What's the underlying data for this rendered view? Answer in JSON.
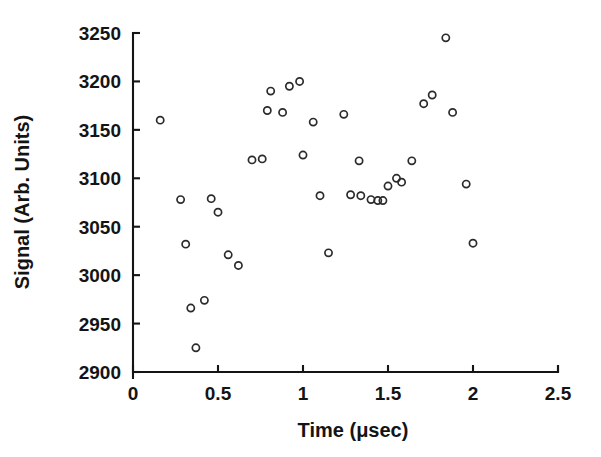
{
  "chart_data": {
    "type": "scatter",
    "title": "",
    "xlabel": "Time (μsec)",
    "ylabel": "Signal (Arb. Units)",
    "xlim": [
      0,
      2.5
    ],
    "ylim": [
      2900,
      3250
    ],
    "xticks": [
      0,
      0.5,
      1,
      1.5,
      2,
      2.5
    ],
    "xtick_labels": [
      "0",
      "0.5",
      "1",
      "1.5",
      "2",
      "2.5"
    ],
    "yticks": [
      2900,
      2950,
      3000,
      3050,
      3100,
      3150,
      3200,
      3250
    ],
    "ytick_labels": [
      "2900",
      "2950",
      "3000",
      "3050",
      "3100",
      "3150",
      "3200",
      "3250"
    ],
    "grid": false,
    "legend": null,
    "marker": "open-circle",
    "marker_color": "#2b2b2b",
    "points": [
      {
        "x": 0.16,
        "y": 3160
      },
      {
        "x": 0.28,
        "y": 3078
      },
      {
        "x": 0.31,
        "y": 3032
      },
      {
        "x": 0.34,
        "y": 2966
      },
      {
        "x": 0.37,
        "y": 2925
      },
      {
        "x": 0.42,
        "y": 2974
      },
      {
        "x": 0.46,
        "y": 3079
      },
      {
        "x": 0.5,
        "y": 3065
      },
      {
        "x": 0.56,
        "y": 3021
      },
      {
        "x": 0.62,
        "y": 3010
      },
      {
        "x": 0.7,
        "y": 3119
      },
      {
        "x": 0.76,
        "y": 3120
      },
      {
        "x": 0.79,
        "y": 3170
      },
      {
        "x": 0.81,
        "y": 3190
      },
      {
        "x": 0.88,
        "y": 3168
      },
      {
        "x": 0.92,
        "y": 3195
      },
      {
        "x": 0.98,
        "y": 3200
      },
      {
        "x": 1.0,
        "y": 3124
      },
      {
        "x": 1.06,
        "y": 3158
      },
      {
        "x": 1.1,
        "y": 3082
      },
      {
        "x": 1.15,
        "y": 3023
      },
      {
        "x": 1.24,
        "y": 3166
      },
      {
        "x": 1.28,
        "y": 3083
      },
      {
        "x": 1.33,
        "y": 3118
      },
      {
        "x": 1.34,
        "y": 3082
      },
      {
        "x": 1.4,
        "y": 3078
      },
      {
        "x": 1.44,
        "y": 3077
      },
      {
        "x": 1.47,
        "y": 3077
      },
      {
        "x": 1.5,
        "y": 3092
      },
      {
        "x": 1.55,
        "y": 3100
      },
      {
        "x": 1.58,
        "y": 3096
      },
      {
        "x": 1.64,
        "y": 3118
      },
      {
        "x": 1.71,
        "y": 3177
      },
      {
        "x": 1.76,
        "y": 3186
      },
      {
        "x": 1.84,
        "y": 3245
      },
      {
        "x": 1.88,
        "y": 3168
      },
      {
        "x": 1.96,
        "y": 3094
      },
      {
        "x": 2.0,
        "y": 3033
      }
    ]
  }
}
